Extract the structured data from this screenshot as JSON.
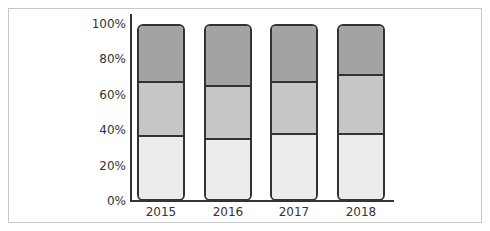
{
  "chart_data": {
    "type": "bar",
    "stacked": true,
    "percent": true,
    "categories": [
      "2015",
      "2016",
      "2017",
      "2018"
    ],
    "series": [
      {
        "name": "Bottom segment",
        "values": [
          37,
          35,
          38,
          38
        ],
        "color": "#ececec"
      },
      {
        "name": "Middle segment",
        "values": [
          31,
          31,
          30,
          34
        ],
        "color": "#c6c6c6"
      },
      {
        "name": "Top segment",
        "values": [
          32,
          34,
          32,
          28
        ],
        "color": "#a3a3a3"
      }
    ],
    "yticks": [
      "0%",
      "20%",
      "40%",
      "60%",
      "80%",
      "100%"
    ],
    "ylim": [
      0,
      100
    ],
    "title": "",
    "xlabel": "",
    "ylabel": "",
    "legend": "none",
    "grid": false
  }
}
